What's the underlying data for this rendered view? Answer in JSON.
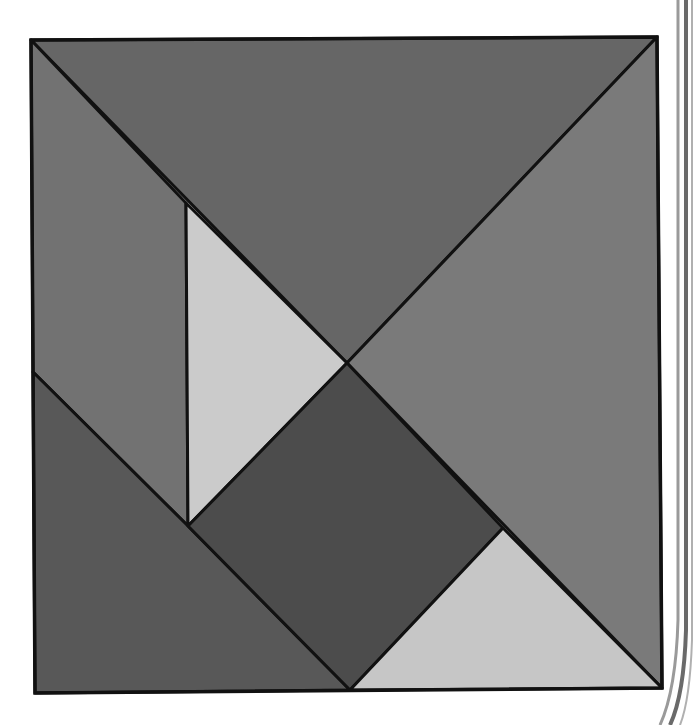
{
  "colors": {
    "background": "#ffffff",
    "outline": "#111111",
    "dark_gray": "#5c5c5c",
    "medium_gray": "#6e6e6e",
    "mid_gray": "#7c7c7c",
    "light_gray": "#c9c9c9",
    "square_gray": "#4f4f4f",
    "binding_edge": "#8a8a8a"
  },
  "pieces": [
    {
      "name": "large-triangle-top",
      "points": "31,40 657,37 347,363",
      "fill": "#666666"
    },
    {
      "name": "large-triangle-right",
      "points": "657,37 662,688 347,363",
      "fill": "#7a7a7a"
    },
    {
      "name": "medium-triangle-left",
      "points": "31,40 347,363 188,526 186,203 33,372",
      "fill": "#727272"
    },
    {
      "name": "small-triangle-left-light",
      "points": "186,203 347,363 188,526",
      "fill": "#cbcbcb"
    },
    {
      "name": "large-triangle-bottom-left",
      "points": "33,372 188,526 350,690 35,693",
      "fill": "#585858"
    },
    {
      "name": "square-center",
      "points": "347,363 503,528 350,690 188,526",
      "fill": "#4c4c4c"
    },
    {
      "name": "small-triangle-bottom-right-light",
      "points": "503,528 662,688 350,690",
      "fill": "#c6c6c6"
    }
  ],
  "outer_square": {
    "points": "31,40 657,37 662,688 35,693"
  }
}
